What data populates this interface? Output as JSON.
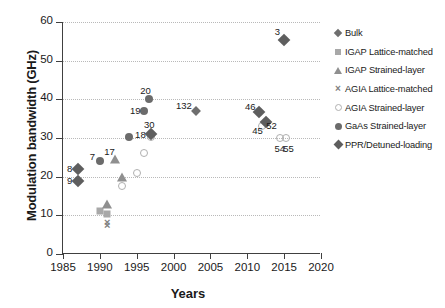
{
  "chart_data": {
    "type": "scatter",
    "title": "",
    "xlabel": "Years",
    "ylabel": "Modulation bandwidth (GHz)",
    "xlim": [
      1985,
      2020
    ],
    "ylim": [
      0,
      60
    ],
    "xticks": [
      1985,
      1990,
      1995,
      2000,
      2005,
      2010,
      2015,
      2020
    ],
    "yticks": [
      0,
      10,
      20,
      30,
      40,
      50,
      60
    ],
    "grid": "horizontal-dotted",
    "legend_position": "right",
    "series": [
      {
        "name": "Bulk",
        "marker": "diamond-bulk",
        "color": "#6e6e6e",
        "points": [
          {
            "x": 2003,
            "y": 37,
            "label": "132"
          }
        ]
      },
      {
        "name": "IGAP Lattice-matched",
        "marker": "square",
        "color": "#a8a8a8",
        "points": [
          {
            "x": 1990,
            "y": 11.2,
            "label": ""
          },
          {
            "x": 1991,
            "y": 10.4,
            "label": ""
          }
        ]
      },
      {
        "name": "IGAP Strained-layer",
        "marker": "triangle",
        "color": "#8f8f8f",
        "points": [
          {
            "x": 1991,
            "y": 13.0,
            "label": ""
          },
          {
            "x": 1992,
            "y": 24.5,
            "label": "17"
          },
          {
            "x": 1993,
            "y": 20.0,
            "label": ""
          }
        ]
      },
      {
        "name": "AGIA Lattice-matched",
        "marker": "cross",
        "color": "#808080",
        "points": [
          {
            "x": 1991,
            "y": 8.2,
            "label": ""
          },
          {
            "x": 1991,
            "y": 7.4,
            "label": ""
          }
        ]
      },
      {
        "name": "AGIA  Strained-layer",
        "marker": "circle-open",
        "color": "#b0b0b0",
        "points": [
          {
            "x": 1993,
            "y": 17.5,
            "label": ""
          },
          {
            "x": 1995,
            "y": 21.0,
            "label": ""
          },
          {
            "x": 1996,
            "y": 26.0,
            "label": ""
          },
          {
            "x": 1997,
            "y": 30.3,
            "label": ""
          },
          {
            "x": 2012,
            "y": 33.0,
            "label": "52"
          },
          {
            "x": 2014.4,
            "y": 30.0,
            "label": "54"
          },
          {
            "x": 2015.3,
            "y": 30.0,
            "label": "55"
          }
        ]
      },
      {
        "name": "GaAs Strained-layer",
        "marker": "circle-fill",
        "color": "#6b6b6b",
        "points": [
          {
            "x": 1990,
            "y": 24.0,
            "label": "7"
          },
          {
            "x": 1994,
            "y": 30.2,
            "label": ""
          },
          {
            "x": 1996,
            "y": 37.0,
            "label": "19"
          },
          {
            "x": 1996.6,
            "y": 40.2,
            "label": "20"
          }
        ]
      },
      {
        "name": "PPR/Detuned-loading",
        "marker": "diamond-ppr",
        "color": "#5e5e5e",
        "points": [
          {
            "x": 1987,
            "y": 22.0,
            "label": "8"
          },
          {
            "x": 1987,
            "y": 19.0,
            "label": "9"
          },
          {
            "x": 1997,
            "y": 31.0,
            "label": "30"
          },
          {
            "x": 2011.6,
            "y": 36.6,
            "label": "46"
          },
          {
            "x": 2012.6,
            "y": 34.2,
            "label": "45"
          },
          {
            "x": 2015,
            "y": 55.4,
            "label": "3"
          }
        ]
      }
    ],
    "annotations": [
      {
        "text": "3",
        "x": 2014.1,
        "y": 57.6
      },
      {
        "text": "20",
        "x": 1996.2,
        "y": 42.4
      },
      {
        "text": "19",
        "x": 1994.8,
        "y": 37.2
      },
      {
        "text": "132",
        "x": 2001.4,
        "y": 38.6
      },
      {
        "text": "30",
        "x": 1996.7,
        "y": 33.6
      },
      {
        "text": "18",
        "x": 1995.5,
        "y": 31.0
      },
      {
        "text": "46",
        "x": 2010.4,
        "y": 38.3
      },
      {
        "text": "52",
        "x": 2013.3,
        "y": 33.4
      },
      {
        "text": "45",
        "x": 2011.4,
        "y": 32.0
      },
      {
        "text": "54",
        "x": 2014.4,
        "y": 27.3
      },
      {
        "text": "55",
        "x": 2015.6,
        "y": 27.3
      },
      {
        "text": "17",
        "x": 1991.3,
        "y": 26.6
      },
      {
        "text": "7",
        "x": 1989.0,
        "y": 25.4
      },
      {
        "text": "8",
        "x": 1985.9,
        "y": 22.2
      },
      {
        "text": "9",
        "x": 1985.9,
        "y": 19.2
      }
    ]
  }
}
